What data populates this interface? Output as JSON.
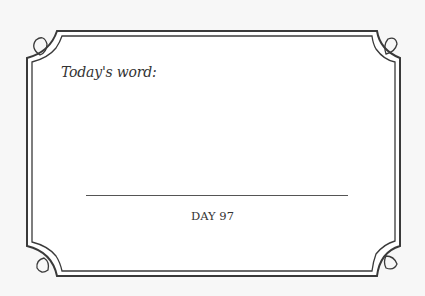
{
  "card": {
    "prompt": "Today's word:",
    "answer_line": "",
    "day_label": "DAY 97"
  },
  "colors": {
    "background": "#f7f7f7",
    "card": "#ffffff",
    "frame": "#3a3a3a",
    "text": "#333333"
  }
}
